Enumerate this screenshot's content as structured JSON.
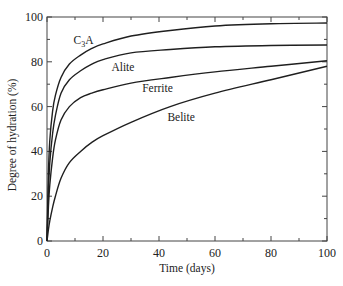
{
  "chart_data": {
    "type": "line",
    "title": "",
    "xlabel": "Time (days)",
    "ylabel": "Degree of hydration (%)",
    "xlim": [
      0,
      100
    ],
    "ylim": [
      0,
      100
    ],
    "x_ticks": [
      0,
      20,
      40,
      60,
      80,
      100
    ],
    "y_ticks": [
      0,
      20,
      40,
      60,
      80,
      100
    ],
    "minor_tick_step": 10,
    "grid": false,
    "legend": "inline labels",
    "series": [
      {
        "name": "C3A",
        "label_display": "C₃A",
        "x": [
          0,
          0.5,
          1,
          2,
          3,
          5,
          8,
          12,
          16,
          20,
          30,
          44,
          60,
          80,
          100
        ],
        "y": [
          0,
          30,
          45,
          58,
          65,
          73,
          79,
          83,
          86,
          88,
          91.5,
          94,
          96,
          97,
          97.3
        ]
      },
      {
        "name": "Alite",
        "label_display": "Alite",
        "x": [
          0,
          0.5,
          1,
          2,
          3,
          5,
          8,
          12,
          16,
          20,
          30,
          44,
          60,
          80,
          100
        ],
        "y": [
          0,
          22,
          35,
          48,
          56,
          66,
          72,
          76,
          79,
          81,
          84,
          85.5,
          86.7,
          87.3,
          87.5
        ]
      },
      {
        "name": "Ferrite",
        "label_display": "Ferrite",
        "x": [
          0,
          0.5,
          1,
          2,
          3,
          5,
          8,
          12,
          16,
          20,
          30,
          44,
          60,
          80,
          100
        ],
        "y": [
          0,
          15,
          25,
          37,
          45,
          54,
          60,
          64,
          66,
          67.5,
          70.5,
          73,
          75.5,
          78,
          80.5
        ]
      },
      {
        "name": "Belite",
        "label_display": "Belite",
        "x": [
          0,
          0.5,
          1,
          2,
          3,
          5,
          8,
          12,
          16,
          20,
          30,
          44,
          60,
          80,
          100
        ],
        "y": [
          0,
          5,
          9,
          15,
          20,
          28,
          35,
          40,
          44,
          47,
          53,
          60,
          66,
          72,
          78
        ]
      }
    ],
    "annotations": [
      {
        "text": "C₃A",
        "x": 9.5,
        "y": 88
      },
      {
        "text": "Alite",
        "x": 23,
        "y": 76
      },
      {
        "text": "Ferrite",
        "x": 34,
        "y": 66.5
      },
      {
        "text": "Belite",
        "x": 43,
        "y": 53.5
      }
    ]
  }
}
